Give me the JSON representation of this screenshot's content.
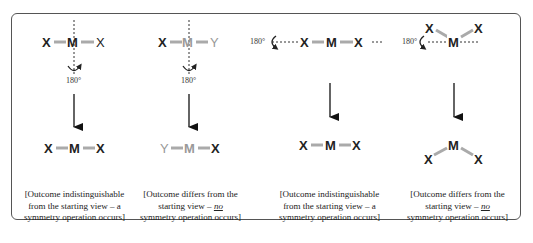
{
  "diagram": {
    "colors": {
      "bond": "#aaaaaa",
      "atom": "#222222",
      "atom_alt": "#999999",
      "frame": "#555555"
    },
    "panels": [
      {
        "id": "panel-1",
        "rotation_label": "180°",
        "axis": "vertical",
        "before": {
          "left": "X",
          "center": "M",
          "right": "X"
        },
        "after": {
          "left": "X",
          "center": "M",
          "right": "X"
        },
        "caption": {
          "line1": "[Outcome indistinguishable",
          "line2": "from the starting view – a",
          "line3": "symmetry operation occurs]"
        }
      },
      {
        "id": "panel-2",
        "rotation_label": "180°",
        "axis": "vertical",
        "before": {
          "left": "X",
          "center": "M",
          "right": "Y"
        },
        "after": {
          "left": "Y",
          "center": "M",
          "right": "X"
        },
        "caption": {
          "line1": "[Outcome differs from the",
          "line2a": "starting view – ",
          "line2b": "no",
          "line3": "symmetry operation occurs]"
        }
      },
      {
        "id": "panel-3",
        "rotation_label": "180°",
        "axis": "horizontal",
        "before": {
          "left": "X",
          "center": "M",
          "right": "X"
        },
        "after": {
          "left": "X",
          "center": "M",
          "right": "X"
        },
        "caption": {
          "line1": "[Outcome indistinguishable",
          "line2": "from the starting view – a",
          "line3": "symmetry operation occurs]"
        }
      },
      {
        "id": "panel-4",
        "rotation_label": "180°",
        "axis": "horizontal",
        "before": {
          "left": "X",
          "center": "M",
          "right": "X",
          "shape": "bent-up"
        },
        "after": {
          "left": "X",
          "center": "M",
          "right": "X",
          "shape": "bent-down"
        },
        "caption": {
          "line1": "[Outcome differs from the",
          "line2a": "starting view – ",
          "line2b": "no",
          "line3": "symmetry operation occurs]"
        }
      }
    ]
  }
}
